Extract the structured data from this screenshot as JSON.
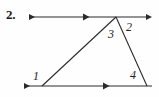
{
  "figure": {
    "problem_number": "2.",
    "background_color": "#fefefe",
    "stroke_color": "#2b2b2b",
    "angle_labels": [
      {
        "id": "angle-1",
        "text": "1",
        "x": 33,
        "y": 70
      },
      {
        "id": "angle-2",
        "text": "2",
        "x": 126,
        "y": 21
      },
      {
        "id": "angle-3",
        "text": "3",
        "x": 108,
        "y": 28
      },
      {
        "id": "angle-4",
        "text": "4",
        "x": 130,
        "y": 69
      }
    ],
    "geometry": {
      "description": "Triangle with a transversal; top line and bottom line are parallel, each marked with a single arrowhead tick.",
      "apex": {
        "x": 116,
        "y": 17
      },
      "bottom_left_vertex": {
        "x": 42,
        "y": 86
      },
      "bottom_right_vertex": {
        "x": 147,
        "y": 86
      },
      "top_line": {
        "x1": 28,
        "y1": 17,
        "x2": 148,
        "y2": 17,
        "arrow_start": true,
        "arrow_end": true,
        "parallel_tick_x": 86
      },
      "bottom_line": {
        "x1": 23,
        "y1": 86,
        "x2": 152,
        "y2": 86,
        "arrow_start": true,
        "arrow_end": false,
        "parallel_tick_x": 106
      }
    }
  }
}
